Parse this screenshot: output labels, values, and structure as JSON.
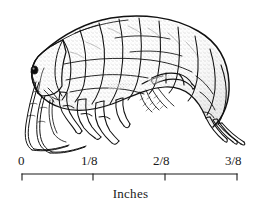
{
  "figure": {
    "kind": "scientific-illustration",
    "background_color": "#ffffff",
    "ink_color": "#111111"
  },
  "scale": {
    "caption": "Inches",
    "ticks": [
      {
        "label": "0",
        "value": 0,
        "x": 22
      },
      {
        "label": "1/8",
        "value": 0.125,
        "x": 93
      },
      {
        "label": "2/8",
        "value": 0.25,
        "x": 165
      },
      {
        "label": "3/8",
        "value": 0.375,
        "x": 237
      }
    ],
    "line_start_x": 22,
    "line_end_x": 237,
    "units": "inches"
  }
}
